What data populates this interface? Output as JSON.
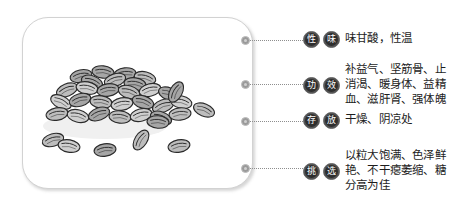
{
  "illustration": {
    "name": "grain-seeds-pile-illustration",
    "description": "黑白手绘谷粒堆",
    "line_color": "#2b2b2b",
    "fill_light": "#d8d8d8",
    "fill_mid": "#b5b5b5",
    "fill_dark": "#8f8f8f"
  },
  "card": {
    "border_color": "#d2d2d2",
    "background": "#ffffff"
  },
  "connector": {
    "dot_color": "#9a9a9a",
    "line_color": "#8e8e8e"
  },
  "badge_style": {
    "background": "#2e2e2e",
    "ring": "#6e6e6e",
    "text_color": "#ffffff"
  },
  "rows": [
    {
      "key": "xingwei",
      "badge_chars": [
        "性",
        "味"
      ],
      "badge_label": "性味",
      "text": "味甘酸，性温"
    },
    {
      "key": "gongxiao",
      "badge_chars": [
        "功",
        "效"
      ],
      "badge_label": "功效",
      "text": "补益气、坚筋骨、止\n消渴、暖身体、益精\n血、滋肝肾、强体魄"
    },
    {
      "key": "cunfang",
      "badge_chars": [
        "存",
        "放"
      ],
      "badge_label": "存放",
      "text": "干燥、阴凉处"
    },
    {
      "key": "tiaoxuan",
      "badge_chars": [
        "挑",
        "选"
      ],
      "badge_label": "挑选",
      "text": "以粒大饱满、色泽鲜\n艳、不干瘪萎缩、糖\n分高为佳"
    }
  ]
}
